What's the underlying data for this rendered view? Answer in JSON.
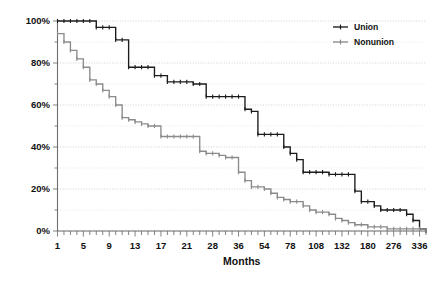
{
  "chart_data": {
    "type": "line",
    "title": "",
    "subtitle": "",
    "xlabel": "Months",
    "ylabel": "",
    "grid": true,
    "grid_orientation": "horizontal",
    "grid_interval_pct": 10,
    "legend_position": "top-right",
    "ylim": [
      0,
      100
    ],
    "ytick_labels": [
      "100%",
      "80%",
      "60%",
      "40%",
      "20%",
      "0%"
    ],
    "ytick_values": [
      100,
      80,
      60,
      40,
      20,
      0
    ],
    "xtick_labels": [
      "1",
      "5",
      "9",
      "13",
      "17",
      "21",
      "28",
      "36",
      "54",
      "78",
      "108",
      "132",
      "180",
      "276",
      "336"
    ],
    "xtick_indices": [
      0,
      4,
      8,
      12,
      16,
      20,
      24,
      28,
      32,
      36,
      40,
      44,
      48,
      52,
      56
    ],
    "x_category_count": 58,
    "series": [
      {
        "name": "Union",
        "color": "#1b1b1b",
        "marker": "cross",
        "values": [
          100,
          100,
          100,
          100,
          100,
          100,
          97,
          97,
          97,
          91,
          91,
          78,
          78,
          78,
          78,
          74,
          74,
          71,
          71,
          71,
          71,
          70,
          70,
          64,
          64,
          64,
          64,
          64,
          64,
          58,
          57,
          46,
          46,
          46,
          46,
          40,
          37,
          34,
          28,
          28,
          28,
          28,
          27,
          27,
          27,
          27,
          19,
          14,
          14,
          12,
          10,
          10,
          10,
          10,
          8,
          5,
          1,
          0
        ]
      },
      {
        "name": "Nonunion",
        "color": "#8b8b8b",
        "marker": "cross",
        "values": [
          94,
          90,
          86,
          82,
          78,
          72,
          70,
          67,
          64,
          60,
          54,
          53,
          52,
          51,
          50,
          50,
          45,
          45,
          45,
          45,
          45,
          45,
          38,
          37,
          37,
          36,
          35,
          35,
          28,
          24,
          21,
          21,
          20,
          18,
          16,
          15,
          14,
          14,
          12,
          10,
          9,
          9,
          8,
          6,
          5,
          4,
          3,
          3,
          2,
          2,
          2,
          1,
          1,
          1,
          1,
          1,
          1,
          0
        ]
      }
    ]
  },
  "legend": {
    "items": [
      {
        "label": "Union",
        "color": "#1b1b1b"
      },
      {
        "label": "Nonunion",
        "color": "#8b8b8b"
      }
    ]
  },
  "axes": {
    "x_title": "Months"
  },
  "colors": {
    "union": "#1b1b1b",
    "nonunion": "#8b8b8b",
    "grid": "#c8c8c8",
    "axis": "#6e6e6e",
    "background": "#ffffff"
  }
}
